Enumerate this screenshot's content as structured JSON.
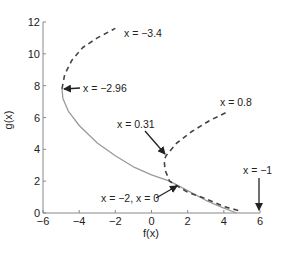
{
  "chart_data": {
    "type": "line",
    "title": "",
    "xlabel": "f(x)",
    "ylabel": "g(x)",
    "xlim": [
      -6,
      6
    ],
    "ylim": [
      0,
      12
    ],
    "xticks": [
      -6,
      -4,
      -2,
      0,
      2,
      4,
      6
    ],
    "yticks": [
      0,
      2,
      4,
      6,
      8,
      10,
      12
    ],
    "grid": false,
    "legend": null,
    "series": [
      {
        "name": "solid curve",
        "style": "solid",
        "color": "#9a9a9a",
        "points": [
          [
            -4.95,
            7.8
          ],
          [
            -4.9,
            7.2
          ],
          [
            -4.6,
            6.4
          ],
          [
            -4.0,
            5.5
          ],
          [
            -3.0,
            4.4
          ],
          [
            -2.0,
            3.6
          ],
          [
            -1.0,
            2.9
          ],
          [
            0.0,
            2.4
          ],
          [
            1.0,
            2.0
          ],
          [
            2.0,
            1.4
          ],
          [
            3.0,
            0.8
          ],
          [
            4.0,
            0.3
          ],
          [
            4.7,
            0.0
          ]
        ]
      },
      {
        "name": "dashed branch upper-left",
        "style": "dashed",
        "color": "#444444",
        "points": [
          [
            -4.95,
            7.8
          ],
          [
            -4.8,
            8.7
          ],
          [
            -4.4,
            9.6
          ],
          [
            -3.8,
            10.4
          ],
          [
            -3.0,
            11.0
          ],
          [
            -2.0,
            11.6
          ]
        ]
      },
      {
        "name": "dashed branch right",
        "style": "dashed",
        "color": "#444444",
        "points": [
          [
            4.1,
            6.3
          ],
          [
            3.2,
            5.8
          ],
          [
            2.2,
            5.1
          ],
          [
            1.4,
            4.4
          ],
          [
            0.8,
            3.6
          ],
          [
            0.7,
            3.3
          ],
          [
            0.75,
            2.7
          ],
          [
            1.0,
            2.0
          ],
          [
            2.0,
            1.3
          ],
          [
            3.0,
            0.9
          ],
          [
            4.0,
            0.4
          ],
          [
            5.0,
            0.1
          ]
        ]
      }
    ],
    "annotations": [
      {
        "text": "x = −3.4",
        "at": [
          -2.0,
          11.6
        ],
        "arrow": false
      },
      {
        "text": "x = −2.96",
        "at": [
          -4.95,
          7.8
        ],
        "arrow": true
      },
      {
        "text": "x = 0.8",
        "at": [
          4.1,
          6.3
        ],
        "arrow": false
      },
      {
        "text": "x = 0.31",
        "at": [
          0.7,
          3.3
        ],
        "arrow": true
      },
      {
        "text": "x = −2, x = 0",
        "at": [
          1.0,
          2.0
        ],
        "arrow": true
      },
      {
        "text": "x = −1",
        "at": [
          5.0,
          0.1
        ],
        "arrow": true
      }
    ]
  },
  "axes": {
    "xlabel": "f(x)",
    "ylabel": "g(x)",
    "xtick_labels": [
      "−6",
      "−4",
      "−2",
      "0",
      "2",
      "4",
      "6"
    ],
    "ytick_labels": [
      "0",
      "2",
      "4",
      "6",
      "8",
      "10",
      "12"
    ]
  },
  "labels": {
    "a1": "x = −3.4",
    "a2": "x = −2.96",
    "a3": "x = 0.8",
    "a4": "x = 0.31",
    "a5": "x = −2, x = 0",
    "a6": "x = −1"
  }
}
